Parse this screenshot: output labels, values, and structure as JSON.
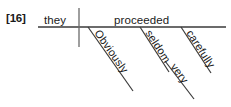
{
  "example": {
    "number_label": "[16]"
  },
  "sentence": {
    "text": "Obviously they seldom proceeded very carefully.",
    "subject": "they",
    "verb": "proceeded"
  },
  "diagram": {
    "type": "reed-kellogg-sentence-diagram",
    "baseline": {
      "x1": 38,
      "y1": 27,
      "x2": 226,
      "y2": 27
    },
    "subject_verb_divider": {
      "x1": 79,
      "y1": 8,
      "x2": 79,
      "y2": 47
    },
    "line_color": "#3a3a3a",
    "text_color": "#1a1a1a",
    "background_color": "#ffffff",
    "nodes": [
      {
        "id": "subject",
        "label": "they",
        "role": "subject",
        "placement": "on-baseline",
        "x": 44,
        "y": 24
      },
      {
        "id": "verb",
        "label": "proceeded",
        "role": "verb",
        "placement": "on-baseline",
        "x": 114,
        "y": 24
      },
      {
        "id": "mod1",
        "label": "Obviously",
        "role": "adverb-modifying-verb",
        "placement": "slanted-below-baseline",
        "line": {
          "x1": 88,
          "y1": 27,
          "x2": 133,
          "y2": 91
        },
        "angle_deg": 55
      },
      {
        "id": "mod2",
        "label": "seldom",
        "role": "adverb-modifying-verb",
        "placement": "slanted-below-baseline",
        "line": {
          "x1": 140,
          "y1": 27,
          "x2": 169,
          "y2": 72
        },
        "angle_deg": 57
      },
      {
        "id": "mod3",
        "label": "carefully",
        "role": "adverb-modifying-verb",
        "placement": "slanted-below-baseline",
        "line": {
          "x1": 181,
          "y1": 27,
          "x2": 211,
          "y2": 73
        },
        "angle_deg": 57
      },
      {
        "id": "mod4",
        "label": "very",
        "role": "adverb-modifying-adverb",
        "modifies": "carefully",
        "placement": "slanted-below-carefully",
        "line": {
          "x1": 165,
          "y1": 61,
          "x2": 194,
          "y2": 99
        },
        "angle_deg": 53
      }
    ]
  }
}
